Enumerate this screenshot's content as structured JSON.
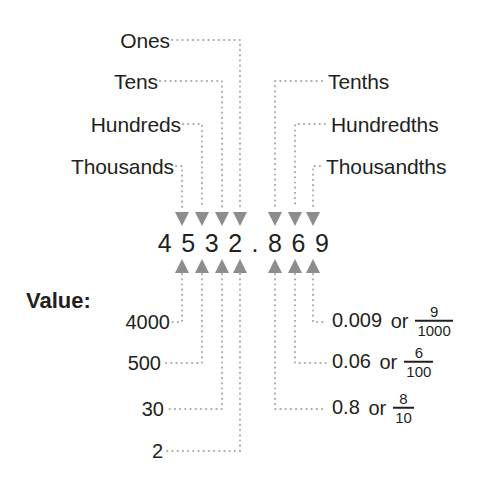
{
  "diagram": {
    "number": "4 5 3 2 . 8 6 9",
    "number_plain": "4532.869",
    "value_caption": "Value:",
    "colors": {
      "text": "#231f20",
      "arrow": "#8d8d8d",
      "dotted": "#a8a8a8",
      "background": "#ffffff"
    }
  },
  "digits": [
    {
      "digit": "4",
      "place": "Thousands",
      "value": "4000"
    },
    {
      "digit": "5",
      "place": "Hundreds",
      "value": "500"
    },
    {
      "digit": "3",
      "place": "Tens",
      "value": "30"
    },
    {
      "digit": "2",
      "place": "Ones",
      "value": "2"
    },
    {
      "digit": "8",
      "place": "Tenths",
      "value": "0.8",
      "fraction_num": "8",
      "fraction_den": "10"
    },
    {
      "digit": "6",
      "place": "Hundredths",
      "value": "0.06",
      "fraction_num": "6",
      "fraction_den": "100"
    },
    {
      "digit": "9",
      "place": "Thousandths",
      "value": "0.009",
      "fraction_num": "9",
      "fraction_den": "1000"
    }
  ],
  "place_labels_left": [
    {
      "text": "Ones"
    },
    {
      "text": "Tens"
    },
    {
      "text": "Hundreds"
    },
    {
      "text": "Thousands"
    }
  ],
  "place_labels_right": [
    {
      "text": "Tenths"
    },
    {
      "text": "Hundredths"
    },
    {
      "text": "Thousandths"
    }
  ],
  "value_labels_left": [
    {
      "text": "4000"
    },
    {
      "text": "500"
    },
    {
      "text": "30"
    },
    {
      "text": "2"
    }
  ],
  "value_labels_right": [
    {
      "decimal": "0.009",
      "or": "or",
      "num": "9",
      "den": "1000"
    },
    {
      "decimal": "0.06",
      "or": "or",
      "num": "6",
      "den": "100"
    },
    {
      "decimal": "0.8",
      "or": "or",
      "num": "8",
      "den": "10"
    }
  ]
}
